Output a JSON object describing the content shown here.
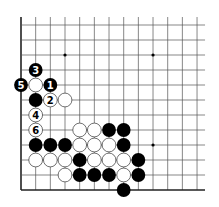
{
  "diagram": {
    "type": "go-board",
    "grid": {
      "columns": 13,
      "rows": 12,
      "origin_x": 21,
      "origin_y": 25,
      "spacing_x": 14.67,
      "spacing_y": 15,
      "open_top": true,
      "open_right": true,
      "left_edge": true,
      "bottom_edge": true
    },
    "colors": {
      "line": "#555555",
      "edge": "#222222",
      "black_stone": "#000000",
      "white_stone": "#ffffff",
      "white_stroke": "#333333"
    },
    "star_points": [
      {
        "col": 3,
        "row": 2
      },
      {
        "col": 9,
        "row": 2
      },
      {
        "col": 9,
        "row": 8
      }
    ],
    "stones": [
      {
        "col": 1,
        "row": 3,
        "color": "black",
        "label": "3"
      },
      {
        "col": 0,
        "row": 4,
        "color": "black",
        "label": "5"
      },
      {
        "col": 1,
        "row": 4,
        "color": "white",
        "label": ""
      },
      {
        "col": 2,
        "row": 4,
        "color": "black",
        "label": "1"
      },
      {
        "col": 1,
        "row": 5,
        "color": "black",
        "label": ""
      },
      {
        "col": 2,
        "row": 5,
        "color": "white",
        "label": "2"
      },
      {
        "col": 3,
        "row": 5,
        "color": "white",
        "label": ""
      },
      {
        "col": 1,
        "row": 6,
        "color": "white",
        "label": "4"
      },
      {
        "col": 1,
        "row": 7,
        "color": "white",
        "label": "6"
      },
      {
        "col": 4,
        "row": 7,
        "color": "white",
        "label": ""
      },
      {
        "col": 5,
        "row": 7,
        "color": "white",
        "label": ""
      },
      {
        "col": 6,
        "row": 7,
        "color": "black",
        "label": ""
      },
      {
        "col": 7,
        "row": 7,
        "color": "black",
        "label": ""
      },
      {
        "col": 1,
        "row": 8,
        "color": "black",
        "label": ""
      },
      {
        "col": 2,
        "row": 8,
        "color": "black",
        "label": ""
      },
      {
        "col": 3,
        "row": 8,
        "color": "black",
        "label": ""
      },
      {
        "col": 4,
        "row": 8,
        "color": "white",
        "label": ""
      },
      {
        "col": 5,
        "row": 8,
        "color": "white",
        "label": ""
      },
      {
        "col": 6,
        "row": 8,
        "color": "white",
        "label": ""
      },
      {
        "col": 7,
        "row": 8,
        "color": "black",
        "label": ""
      },
      {
        "col": 1,
        "row": 9,
        "color": "white",
        "label": ""
      },
      {
        "col": 2,
        "row": 9,
        "color": "white",
        "label": ""
      },
      {
        "col": 3,
        "row": 9,
        "color": "white",
        "label": ""
      },
      {
        "col": 4,
        "row": 9,
        "color": "black",
        "label": ""
      },
      {
        "col": 5,
        "row": 9,
        "color": "white",
        "label": ""
      },
      {
        "col": 6,
        "row": 9,
        "color": "white",
        "label": ""
      },
      {
        "col": 7,
        "row": 9,
        "color": "white",
        "label": ""
      },
      {
        "col": 8,
        "row": 9,
        "color": "black",
        "label": ""
      },
      {
        "col": 3,
        "row": 10,
        "color": "white",
        "label": ""
      },
      {
        "col": 4,
        "row": 10,
        "color": "black",
        "label": ""
      },
      {
        "col": 5,
        "row": 10,
        "color": "black",
        "label": ""
      },
      {
        "col": 6,
        "row": 10,
        "color": "black",
        "label": ""
      },
      {
        "col": 7,
        "row": 10,
        "color": "white",
        "label": ""
      },
      {
        "col": 8,
        "row": 10,
        "color": "black",
        "label": ""
      },
      {
        "col": 7,
        "row": 11,
        "color": "black",
        "label": ""
      }
    ]
  }
}
